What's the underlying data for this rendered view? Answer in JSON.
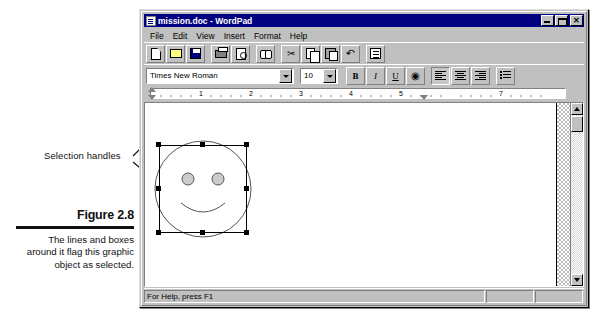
{
  "figure": {
    "title": "Figure 2.8",
    "caption": "The lines and boxes around it flag this graphic object as selected.",
    "annotation_label": "Selection handles"
  },
  "window": {
    "title": "mission.doc - WordPad",
    "icon": "document-icon",
    "controls": {
      "minimize": "minimize-icon",
      "maximize": "maximize-icon",
      "close": "✕"
    }
  },
  "menu": {
    "items": [
      {
        "label": "File"
      },
      {
        "label": "Edit"
      },
      {
        "label": "View"
      },
      {
        "label": "Insert"
      },
      {
        "label": "Format"
      },
      {
        "label": "Help"
      }
    ]
  },
  "toolbar": {
    "buttons": [
      {
        "name": "new-button",
        "icon": "new-document-icon"
      },
      {
        "name": "open-button",
        "icon": "open-folder-icon"
      },
      {
        "name": "save-button",
        "icon": "floppy-disk-icon"
      },
      {
        "name": "separator-1",
        "icon": "separator"
      },
      {
        "name": "print-button",
        "icon": "printer-icon"
      },
      {
        "name": "print-preview-button",
        "icon": "print-preview-icon"
      },
      {
        "name": "separator-2",
        "icon": "separator"
      },
      {
        "name": "find-button",
        "icon": "binoculars-icon"
      },
      {
        "name": "separator-3",
        "icon": "separator"
      },
      {
        "name": "cut-button",
        "icon": "scissors-icon"
      },
      {
        "name": "copy-button",
        "icon": "copy-icon"
      },
      {
        "name": "paste-button",
        "icon": "clipboard-paste-icon"
      },
      {
        "name": "undo-button",
        "icon": "undo-arrow-icon"
      },
      {
        "name": "separator-4",
        "icon": "separator"
      },
      {
        "name": "date-time-button",
        "icon": "date-time-icon"
      }
    ]
  },
  "format_bar": {
    "font_name": "Times New Roman",
    "font_size": "10",
    "buttons": [
      {
        "name": "bold-button",
        "label": "B",
        "pressed": false
      },
      {
        "name": "italic-button",
        "label": "I",
        "pressed": false
      },
      {
        "name": "underline-button",
        "label": "U",
        "pressed": false
      },
      {
        "name": "text-color-button",
        "label": "",
        "pressed": false
      },
      {
        "name": "align-left-button",
        "label": "",
        "pressed": true
      },
      {
        "name": "align-center-button",
        "label": "",
        "pressed": false
      },
      {
        "name": "align-right-button",
        "label": "",
        "pressed": false
      },
      {
        "name": "bullets-button",
        "label": "",
        "pressed": false
      }
    ]
  },
  "ruler": {
    "numbers": [
      "1",
      "2",
      "3",
      "4",
      "5",
      "7"
    ]
  },
  "document": {
    "graphic_object": {
      "name": "smiley-face-graphic",
      "selected": true,
      "handle_count": 8
    }
  },
  "status_bar": {
    "text": "For Help, press F1"
  }
}
